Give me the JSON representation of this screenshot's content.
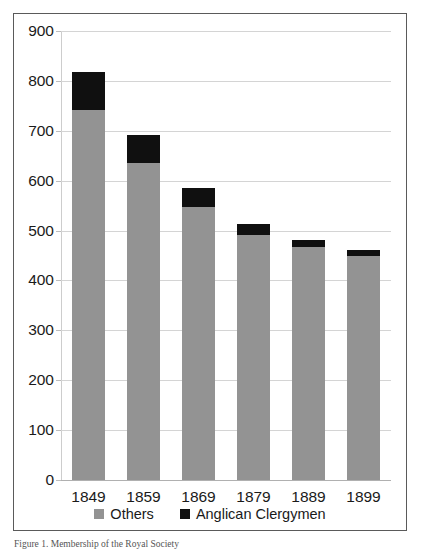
{
  "chart_data": {
    "type": "bar",
    "subtype": "stacked-vertical",
    "title": "",
    "xlabel": "",
    "ylabel": "",
    "categories": [
      "1849",
      "1859",
      "1869",
      "1879",
      "1889",
      "1899"
    ],
    "series": [
      {
        "name": "Others",
        "color": "#939393",
        "values": [
          741,
          635,
          548,
          492,
          467,
          450
        ]
      },
      {
        "name": "Anglican Clergymen",
        "color": "#101010",
        "values": [
          77,
          57,
          38,
          22,
          14,
          11
        ]
      }
    ],
    "totals": [
      818,
      692,
      586,
      514,
      481,
      461
    ],
    "ylim": [
      0,
      900
    ],
    "ytick_step": 100,
    "yticks": [
      "900",
      "800",
      "700",
      "600",
      "500",
      "400",
      "300",
      "200",
      "100",
      "0"
    ],
    "grid": true,
    "legend_position": "bottom"
  },
  "legend": {
    "items": [
      {
        "label": "Others",
        "swatch": "others-swatch-icon"
      },
      {
        "label": "Anglican Clergymen",
        "swatch": "anglican-swatch-icon"
      }
    ]
  },
  "caption": {
    "text": "Figure 1. Membership of the Royal Society"
  }
}
